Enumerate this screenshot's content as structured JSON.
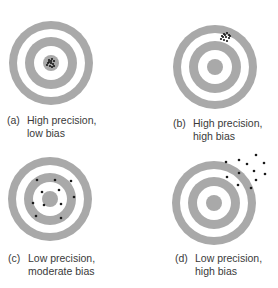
{
  "figure": {
    "ring_color": "#a9a9a9",
    "dot_color": "#1a1a1a",
    "panels": [
      {
        "id": "a",
        "tag": "(a)",
        "line1": "High precision,",
        "line2": "low bias",
        "precision": "high",
        "bias": "low",
        "target": {
          "cx": 51,
          "cy": 63
        },
        "label_pos": {
          "x": 7,
          "y": 114
        },
        "dots": [
          [
            49,
            60
          ],
          [
            52,
            59
          ],
          [
            54,
            61
          ],
          [
            48,
            63
          ],
          [
            51,
            63
          ],
          [
            53,
            64
          ],
          [
            50,
            66
          ],
          [
            52,
            67
          ],
          [
            49,
            62
          ],
          [
            54,
            66
          ],
          [
            47,
            65
          ],
          [
            51,
            61
          ]
        ]
      },
      {
        "id": "b",
        "tag": "(b)",
        "line1": "High precision,",
        "line2": "high bias",
        "precision": "high",
        "bias": "high",
        "target": {
          "cx": 215,
          "cy": 67
        },
        "label_pos": {
          "x": 173,
          "y": 117
        },
        "dots": [
          [
            224,
            34
          ],
          [
            227,
            33
          ],
          [
            229,
            35
          ],
          [
            223,
            37
          ],
          [
            226,
            37
          ],
          [
            229,
            38
          ],
          [
            221,
            39
          ],
          [
            224,
            40
          ],
          [
            227,
            41
          ],
          [
            225,
            35
          ],
          [
            230,
            36
          ],
          [
            222,
            36
          ]
        ]
      },
      {
        "id": "c",
        "tag": "(c)",
        "line1": "Low precision,",
        "line2": "moderate bias",
        "precision": "low",
        "bias": "moderate",
        "target": {
          "cx": 50,
          "cy": 199
        },
        "label_pos": {
          "x": 8,
          "y": 252
        },
        "dots": [
          [
            37,
            180
          ],
          [
            55,
            180
          ],
          [
            71,
            181
          ],
          [
            42,
            192
          ],
          [
            59,
            190
          ],
          [
            74,
            197
          ],
          [
            33,
            203
          ],
          [
            44,
            205
          ],
          [
            61,
            204
          ],
          [
            36,
            216
          ],
          [
            61,
            218
          ]
        ]
      },
      {
        "id": "d",
        "tag": "(d)",
        "line1": "Low precision,",
        "line2": "high bias",
        "precision": "low",
        "bias": "high",
        "target": {
          "cx": 214,
          "cy": 203
        },
        "label_pos": {
          "x": 175,
          "y": 252
        },
        "dots": [
          [
            256,
            155
          ],
          [
            239,
            160
          ],
          [
            226,
            162
          ],
          [
            247,
            164
          ],
          [
            264,
            163
          ],
          [
            254,
            171
          ],
          [
            239,
            173
          ],
          [
            265,
            174
          ],
          [
            227,
            177
          ],
          [
            256,
            180
          ],
          [
            238,
            185
          ],
          [
            251,
            188
          ]
        ]
      }
    ]
  }
}
